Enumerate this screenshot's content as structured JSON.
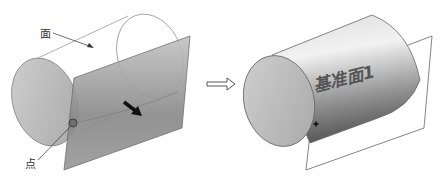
{
  "diagram": {
    "left": {
      "labels": {
        "face": "面",
        "point": "点"
      }
    },
    "arrow": "transform-arrow",
    "right": {
      "plane_label": "基准面1"
    }
  },
  "colors": {
    "plane_fill": "#8c8c8c",
    "cylinder_cap": "#bdbdbd",
    "outline": "#555555",
    "point": "#6e6e6e"
  }
}
